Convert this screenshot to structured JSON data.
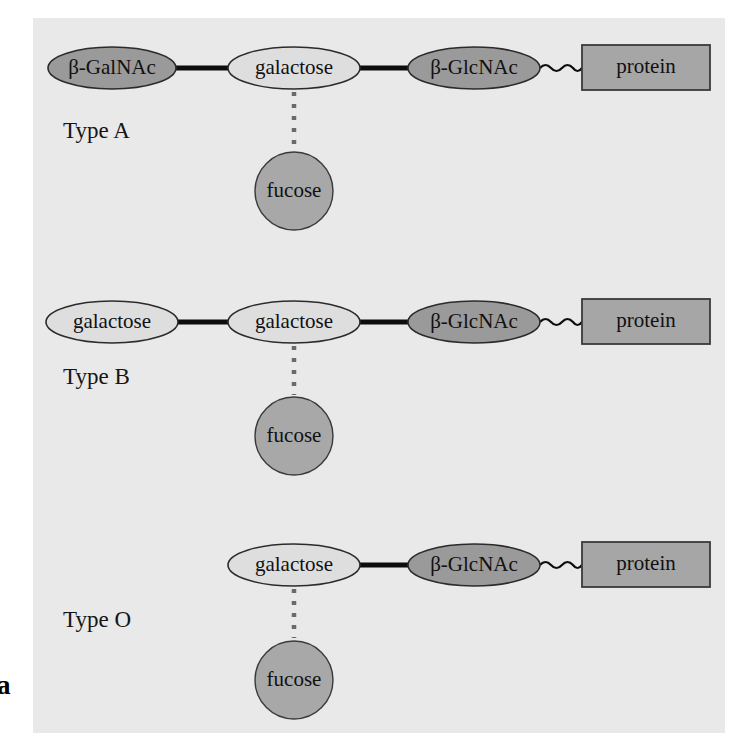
{
  "figure": {
    "partial_label": "a",
    "panel_background": "#e9e9e9",
    "page_background": "#ffffff"
  },
  "colors": {
    "oval_light_fill": "#dedede",
    "oval_dark_fill": "#9a9a9a",
    "circle_fill": "#a8a8a8",
    "protein_fill": "#a6a6a6",
    "outline": "#2b2b2b",
    "bond": "#0d0d0d",
    "dotted_bond": "#6a6a6a"
  },
  "rows": [
    {
      "id": "type-a",
      "type_label": "Type A",
      "chain": [
        {
          "id": "terminal-sugar",
          "label": "β-GalNAc",
          "shape": "oval",
          "tone": "dark",
          "cx": 112,
          "cy": 68,
          "rx": 64,
          "ry": 21
        },
        {
          "id": "galactose",
          "label": "galactose",
          "shape": "oval",
          "tone": "light",
          "cx": 294,
          "cy": 68,
          "rx": 66,
          "ry": 21
        },
        {
          "id": "glcnac",
          "label": "β-GlcNAc",
          "shape": "oval",
          "tone": "dark",
          "cx": 474,
          "cy": 68,
          "rx": 66,
          "ry": 21
        },
        {
          "id": "protein",
          "label": "protein",
          "shape": "rect",
          "tone": "protein",
          "x": 582,
          "y": 45,
          "w": 128,
          "h": 45
        }
      ],
      "branch": {
        "id": "fucose",
        "label": "fucose",
        "shape": "circle",
        "tone": "circle",
        "cx": 294,
        "cy": 191,
        "r": 39
      },
      "dotted_from_y": 92,
      "dotted_to_y": 150,
      "type_label_x": 63,
      "type_label_y": 133
    },
    {
      "id": "type-b",
      "type_label": "Type B",
      "chain": [
        {
          "id": "terminal-sugar",
          "label": "galactose",
          "shape": "oval",
          "tone": "light",
          "cx": 112,
          "cy": 322,
          "rx": 66,
          "ry": 21
        },
        {
          "id": "galactose",
          "label": "galactose",
          "shape": "oval",
          "tone": "light",
          "cx": 294,
          "cy": 322,
          "rx": 66,
          "ry": 21
        },
        {
          "id": "glcnac",
          "label": "β-GlcNAc",
          "shape": "oval",
          "tone": "dark",
          "cx": 474,
          "cy": 322,
          "rx": 66,
          "ry": 21
        },
        {
          "id": "protein",
          "label": "protein",
          "shape": "rect",
          "tone": "protein",
          "x": 582,
          "y": 299,
          "w": 128,
          "h": 45
        }
      ],
      "branch": {
        "id": "fucose",
        "label": "fucose",
        "shape": "circle",
        "tone": "circle",
        "cx": 294,
        "cy": 436,
        "r": 39
      },
      "dotted_from_y": 346,
      "dotted_to_y": 395,
      "type_label_x": 63,
      "type_label_y": 379
    },
    {
      "id": "type-o",
      "type_label": "Type O",
      "chain": [
        {
          "id": "galactose",
          "label": "galactose",
          "shape": "oval",
          "tone": "light",
          "cx": 294,
          "cy": 565,
          "rx": 66,
          "ry": 21
        },
        {
          "id": "glcnac",
          "label": "β-GlcNAc",
          "shape": "oval",
          "tone": "dark",
          "cx": 474,
          "cy": 565,
          "rx": 66,
          "ry": 21
        },
        {
          "id": "protein",
          "label": "protein",
          "shape": "rect",
          "tone": "protein",
          "x": 582,
          "y": 542,
          "w": 128,
          "h": 45
        }
      ],
      "branch": {
        "id": "fucose",
        "label": "fucose",
        "shape": "circle",
        "tone": "circle",
        "cx": 294,
        "cy": 680,
        "r": 39
      },
      "dotted_from_y": 589,
      "dotted_to_y": 638,
      "type_label_x": 63,
      "type_label_y": 622
    }
  ]
}
